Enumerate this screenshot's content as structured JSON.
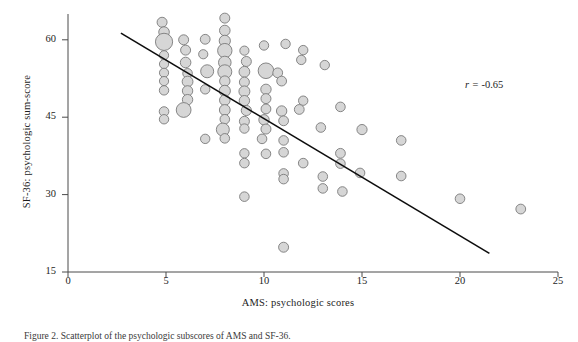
{
  "chart_data": {
    "type": "scatter",
    "title": "",
    "subtitle": "",
    "xlabel": "AMS: psychologic scores",
    "ylabel": "SF-36: psychologic sum-score",
    "xlim": [
      0,
      25
    ],
    "ylim": [
      15,
      65
    ],
    "xticks": [
      0,
      5,
      10,
      15,
      20,
      25
    ],
    "yticks": [
      15,
      30,
      45,
      60
    ],
    "xtick_labels": [
      "0",
      "5",
      "10",
      "15",
      "20",
      "25"
    ],
    "ytick_labels": [
      "15",
      "30",
      "45",
      "60"
    ],
    "grid": false,
    "legend": "none",
    "annotations": [
      {
        "name": "correlation-coefficient",
        "symbol": "r",
        "equals": " = ",
        "value": "-0.65",
        "text": "r = -0.65",
        "x": 20.3,
        "y": 57.5
      }
    ],
    "marker_style": {
      "shape": "circle",
      "fill": "#d6d6d6",
      "stroke": "#7a7a7a",
      "stroke_width": 0.9,
      "size_encodes": "overlapping-count"
    },
    "trendline": {
      "name": "regression-line",
      "type": "linear",
      "color": "#0d0d0d",
      "width": 1.6,
      "x_start": 2.7,
      "y_start": 61.3,
      "x_end": 21.5,
      "y_end": 18.6
    },
    "points": [
      {
        "x": 4.8,
        "y": 63.4,
        "r": 5.0
      },
      {
        "x": 8.0,
        "y": 64.2,
        "r": 5.0
      },
      {
        "x": 4.9,
        "y": 61.5,
        "r": 5.3
      },
      {
        "x": 8.0,
        "y": 61.8,
        "r": 5.3
      },
      {
        "x": 4.9,
        "y": 59.6,
        "r": 8.6
      },
      {
        "x": 5.9,
        "y": 60.0,
        "r": 5.0
      },
      {
        "x": 7.0,
        "y": 60.1,
        "r": 4.9
      },
      {
        "x": 8.0,
        "y": 59.8,
        "r": 5.6
      },
      {
        "x": 6.0,
        "y": 58.0,
        "r": 5.0
      },
      {
        "x": 8.0,
        "y": 57.9,
        "r": 7.2
      },
      {
        "x": 4.9,
        "y": 57.0,
        "r": 4.6
      },
      {
        "x": 6.9,
        "y": 57.2,
        "r": 4.6
      },
      {
        "x": 9.0,
        "y": 57.9,
        "r": 4.6
      },
      {
        "x": 10.0,
        "y": 58.9,
        "r": 4.7
      },
      {
        "x": 11.1,
        "y": 59.2,
        "r": 4.7
      },
      {
        "x": 12.0,
        "y": 58.0,
        "r": 4.7
      },
      {
        "x": 11.9,
        "y": 56.1,
        "r": 4.7
      },
      {
        "x": 4.9,
        "y": 55.3,
        "r": 4.6
      },
      {
        "x": 6.0,
        "y": 55.6,
        "r": 5.3
      },
      {
        "x": 8.0,
        "y": 55.6,
        "r": 6.3
      },
      {
        "x": 9.1,
        "y": 55.8,
        "r": 5.0
      },
      {
        "x": 13.1,
        "y": 55.1,
        "r": 4.7
      },
      {
        "x": 4.9,
        "y": 53.6,
        "r": 4.6
      },
      {
        "x": 6.1,
        "y": 53.5,
        "r": 4.8
      },
      {
        "x": 7.1,
        "y": 53.9,
        "r": 6.5
      },
      {
        "x": 8.0,
        "y": 53.8,
        "r": 7.0
      },
      {
        "x": 9.0,
        "y": 53.8,
        "r": 5.4
      },
      {
        "x": 10.1,
        "y": 54.0,
        "r": 7.8
      },
      {
        "x": 10.7,
        "y": 53.6,
        "r": 4.9
      },
      {
        "x": 4.9,
        "y": 52.0,
        "r": 4.6
      },
      {
        "x": 6.1,
        "y": 51.9,
        "r": 5.4
      },
      {
        "x": 8.0,
        "y": 52.0,
        "r": 5.2
      },
      {
        "x": 9.0,
        "y": 51.8,
        "r": 5.0
      },
      {
        "x": 10.9,
        "y": 52.0,
        "r": 4.9
      },
      {
        "x": 4.9,
        "y": 50.2,
        "r": 4.7
      },
      {
        "x": 6.1,
        "y": 50.1,
        "r": 5.2
      },
      {
        "x": 7.0,
        "y": 50.4,
        "r": 4.7
      },
      {
        "x": 8.0,
        "y": 50.1,
        "r": 5.6
      },
      {
        "x": 9.0,
        "y": 50.0,
        "r": 5.5
      },
      {
        "x": 10.1,
        "y": 50.4,
        "r": 5.2
      },
      {
        "x": 6.1,
        "y": 48.4,
        "r": 5.2
      },
      {
        "x": 8.0,
        "y": 48.3,
        "r": 5.3
      },
      {
        "x": 9.0,
        "y": 48.2,
        "r": 5.2
      },
      {
        "x": 10.1,
        "y": 48.6,
        "r": 5.0
      },
      {
        "x": 12.0,
        "y": 48.2,
        "r": 4.7
      },
      {
        "x": 4.9,
        "y": 46.1,
        "r": 4.8
      },
      {
        "x": 5.9,
        "y": 46.4,
        "r": 7.4
      },
      {
        "x": 8.0,
        "y": 46.4,
        "r": 5.4
      },
      {
        "x": 9.1,
        "y": 46.3,
        "r": 5.1
      },
      {
        "x": 10.1,
        "y": 46.6,
        "r": 4.9
      },
      {
        "x": 10.9,
        "y": 46.2,
        "r": 5.2
      },
      {
        "x": 11.8,
        "y": 46.5,
        "r": 4.9
      },
      {
        "x": 13.9,
        "y": 47.0,
        "r": 4.8
      },
      {
        "x": 4.9,
        "y": 44.6,
        "r": 4.7
      },
      {
        "x": 8.0,
        "y": 44.6,
        "r": 4.8
      },
      {
        "x": 9.0,
        "y": 44.2,
        "r": 5.0
      },
      {
        "x": 10.0,
        "y": 44.5,
        "r": 5.2
      },
      {
        "x": 11.0,
        "y": 44.3,
        "r": 4.9
      },
      {
        "x": 7.9,
        "y": 42.6,
        "r": 6.5
      },
      {
        "x": 9.0,
        "y": 42.8,
        "r": 4.7
      },
      {
        "x": 10.1,
        "y": 42.7,
        "r": 5.0
      },
      {
        "x": 12.9,
        "y": 43.0,
        "r": 4.8
      },
      {
        "x": 15.0,
        "y": 42.6,
        "r": 5.1
      },
      {
        "x": 7.0,
        "y": 40.8,
        "r": 4.7
      },
      {
        "x": 8.0,
        "y": 40.9,
        "r": 4.8
      },
      {
        "x": 9.9,
        "y": 40.8,
        "r": 4.8
      },
      {
        "x": 11.0,
        "y": 40.5,
        "r": 4.8
      },
      {
        "x": 17.0,
        "y": 40.5,
        "r": 4.8
      },
      {
        "x": 9.0,
        "y": 38.0,
        "r": 4.7
      },
      {
        "x": 10.1,
        "y": 37.9,
        "r": 4.8
      },
      {
        "x": 11.0,
        "y": 38.2,
        "r": 4.8
      },
      {
        "x": 13.9,
        "y": 38.0,
        "r": 4.9
      },
      {
        "x": 9.0,
        "y": 36.1,
        "r": 4.8
      },
      {
        "x": 12.0,
        "y": 36.1,
        "r": 4.8
      },
      {
        "x": 13.9,
        "y": 36.0,
        "r": 4.8
      },
      {
        "x": 11.0,
        "y": 34.1,
        "r": 4.8
      },
      {
        "x": 11.0,
        "y": 33.0,
        "r": 4.8
      },
      {
        "x": 13.0,
        "y": 33.5,
        "r": 4.8
      },
      {
        "x": 14.9,
        "y": 34.2,
        "r": 4.8
      },
      {
        "x": 17.0,
        "y": 33.6,
        "r": 4.8
      },
      {
        "x": 13.0,
        "y": 31.2,
        "r": 4.8
      },
      {
        "x": 14.0,
        "y": 30.6,
        "r": 4.8
      },
      {
        "x": 20.0,
        "y": 29.2,
        "r": 4.8
      },
      {
        "x": 9.0,
        "y": 29.6,
        "r": 4.8
      },
      {
        "x": 23.1,
        "y": 27.2,
        "r": 4.9
      },
      {
        "x": 11.0,
        "y": 19.8,
        "r": 5.0
      }
    ]
  },
  "caption": {
    "label": "Figure 2.",
    "text": "Figure 2.  Scatterplot of the psychologic subscores of AMS and SF-36."
  }
}
